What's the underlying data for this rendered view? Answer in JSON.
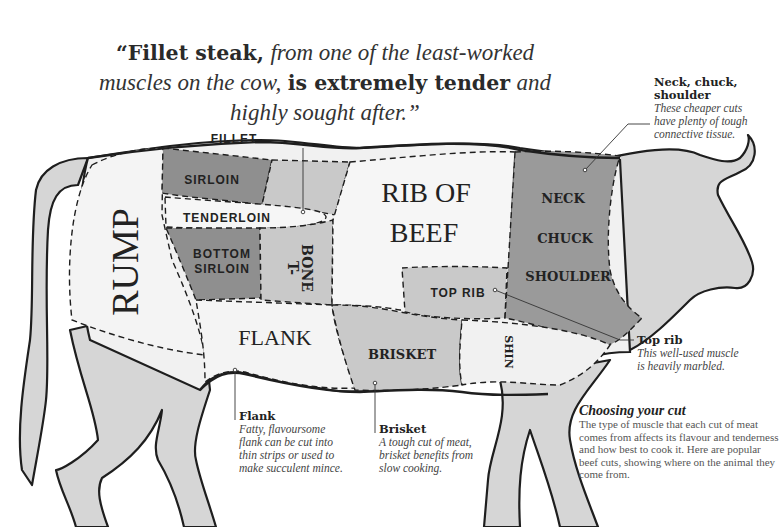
{
  "quote": {
    "part1_bold": "“Fillet steak,",
    "part2_italic": "from one of the least-worked muscles on the cow,",
    "part3_bold": "is extremely tender",
    "part4_italic": "and highly sought after.",
    "close": "”"
  },
  "regions": {
    "rump": "RUMP",
    "sirloin": "SIRLOIN",
    "fillet": "FILLET",
    "tenderloin": "TENDERLOIN",
    "bottom_sirloin_1": "BOTTOM",
    "bottom_sirloin_2": "SIRLOIN",
    "tbone_1": "T-",
    "tbone_2": "BONE",
    "rib_1": "RIB OF",
    "rib_2": "BEEF",
    "top_rib": "TOP RIB",
    "neck": "NECK",
    "chuck": "CHUCK",
    "shoulder": "SHOULDER",
    "flank": "FLANK",
    "brisket": "BRISKET",
    "shin": "SHIN"
  },
  "callouts": {
    "neck": {
      "title": "Neck, chuck, shoulder",
      "title_line1": "Neck, chuck,",
      "title_line2": "shoulder",
      "desc_lines": [
        "These cheaper cuts",
        "have plenty of tough",
        "connective tissue."
      ]
    },
    "top_rib": {
      "title": "Top rib",
      "desc_lines": [
        "This well-used muscle",
        "is heavily marbled."
      ]
    },
    "flank": {
      "title": "Flank",
      "desc_lines": [
        "Fatty, flavoursome",
        "flank can be cut into",
        "thin strips or used to",
        "make succulent mince."
      ]
    },
    "brisket": {
      "title": "Brisket",
      "desc_lines": [
        "A tough cut of meat,",
        "brisket benefits from",
        "slow cooking."
      ]
    }
  },
  "choosing": {
    "title": "Choosing your cut",
    "body": "The type of muscle that each cut of meat comes from affects its flavour and tenderness and how best to cook it. Here are popular beef cuts, showing where on the animal they come from."
  },
  "colors": {
    "dark_cut": "#8f8f8f",
    "medium_cut": "#c9c9c9",
    "light_cut": "#f1f1f1",
    "body_grey": "#d6d6d6",
    "outline": "#1e1e1e"
  }
}
